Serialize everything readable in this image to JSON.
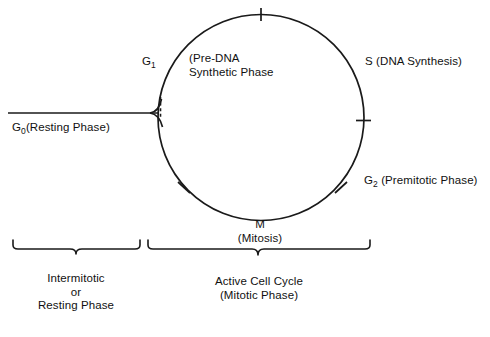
{
  "diagram": {
    "background_color": "#ffffff",
    "line_color": "#1a1a1a",
    "text_color": "#111111"
  },
  "labels": {
    "g1": "G",
    "g1_sub": "1",
    "pre_dna": "(Pre-DNA\nSynthetic Phase",
    "s_phase": "S (DNA Synthesis)",
    "g2": "G",
    "g2_sub": "2",
    "g2_rest": " (Premitotic Phase)",
    "g0": "G",
    "g0_sub": "0",
    "g0_rest": "(Resting Phase)",
    "mitosis": "M\n(Mitosis)",
    "intermitotic": "Intermitotic\nor\nResting Phase",
    "active_cycle": "Active Cell Cycle\n(Mitotic Phase)"
  },
  "cycle_geometry": {
    "center_x": 261,
    "center_y": 117.5,
    "radius": 103,
    "tick_angles_deg": [
      90,
      0,
      -52,
      -128
    ],
    "tick_names": [
      "top-tick",
      "right-tick",
      "lower-right-tick",
      "lower-left-tick"
    ]
  },
  "brackets": {
    "left": {
      "name": "intermitotic-bracket",
      "x_start": 13,
      "x_end": 140,
      "notch_x": 76,
      "y": 241
    },
    "right": {
      "name": "active-cycle-bracket",
      "x_start": 148,
      "x_end": 370,
      "notch_x": 258,
      "y": 241
    }
  },
  "g0_branch": {
    "line_y": 113,
    "line_x_start": 8,
    "junction_x": 160,
    "junction_y": 110
  }
}
